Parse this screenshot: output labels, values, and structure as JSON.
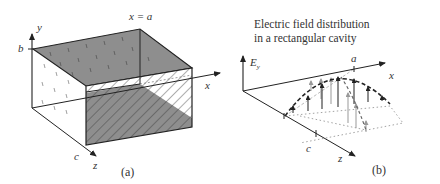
{
  "figure": {
    "panel_a": {
      "caption": "(a)",
      "labels": {
        "y_axis": "y",
        "x_axis": "x",
        "z_axis": "z",
        "b": "b",
        "c": "c",
        "x_eq_a": "x = a"
      },
      "description": "Rectangular cavity with dimensions a × b × c; shaded top and bottom walls, hatched end wall at x = a"
    },
    "panel_b": {
      "caption": "(b)",
      "title_line1": "Electric field distribution",
      "title_line2": "in a rectangular cavity",
      "labels": {
        "ey_axis": "E",
        "ey_sub": "y",
        "x_axis": "x",
        "z_axis": "z",
        "a": "a",
        "c": "c"
      },
      "description": "Sinusoidal half-wave E_y distribution across x and z, drawn as vertical arrows under dashed envelope curves"
    }
  }
}
